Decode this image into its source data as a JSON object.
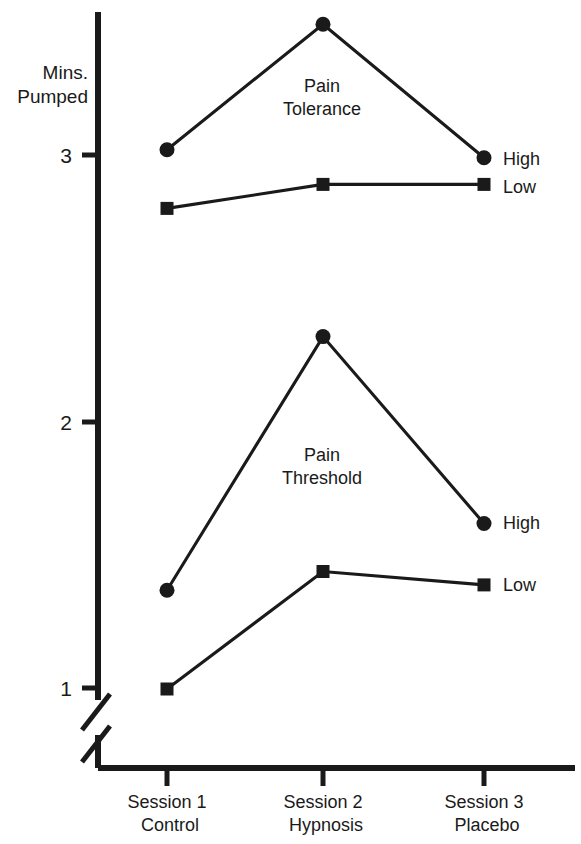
{
  "chart_data": {
    "type": "line",
    "title": "",
    "xlabel": "",
    "ylabel": "Mins. Pumped",
    "categories": [
      "Session 1\nControl",
      "Session 2\nHypnosis",
      "Session 3\nPlacebo"
    ],
    "x_tick_labels": [
      {
        "line1": "Session 1",
        "line2": "Control"
      },
      {
        "line1": "Session 2",
        "line2": "Hypnosis"
      },
      {
        "line1": "Session 3",
        "line2": "Placebo"
      }
    ],
    "y_tick_labels": [
      "3",
      "2",
      "1"
    ],
    "y_tick_values": [
      3,
      2,
      1
    ],
    "ylim": [
      0.85,
      3.62
    ],
    "axis_break": true,
    "grid": false,
    "legend_position": "right-inline",
    "groups": [
      {
        "name": "Pain Tolerance",
        "annotation": {
          "line1": "Pain",
          "line2": "Tolerance"
        },
        "series": [
          {
            "name": "High",
            "marker": "circle",
            "values": [
              3.02,
              3.49,
              2.99
            ],
            "label": "High"
          },
          {
            "name": "Low",
            "marker": "square",
            "values": [
              2.8,
              2.89,
              2.89
            ],
            "label": "Low"
          }
        ]
      },
      {
        "name": "Pain Threshold",
        "annotation": {
          "line1": "Pain",
          "line2": "Threshold"
        },
        "series": [
          {
            "name": "High",
            "marker": "circle",
            "values": [
              1.37,
              2.32,
              1.62
            ],
            "label": "High"
          },
          {
            "name": "Low",
            "marker": "square",
            "values": [
              1.0,
              1.44,
              1.39
            ],
            "label": "Low"
          }
        ]
      }
    ],
    "axis_label_lines": {
      "line1": "Mins.",
      "line2": "Pumped"
    },
    "colors": {
      "ink": "#1a1a1a",
      "background": "#ffffff"
    }
  }
}
